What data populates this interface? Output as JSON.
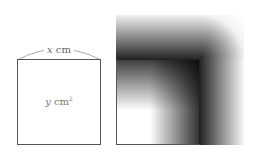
{
  "figure": {
    "left_square": {
      "side_label_var": "x",
      "side_label_unit": " cm",
      "area_label_var": "y",
      "area_label_unit": " cm",
      "area_label_exp": "2"
    },
    "right_square": {
      "description": "square with gradient shading extending outward along top and right edges"
    }
  }
}
